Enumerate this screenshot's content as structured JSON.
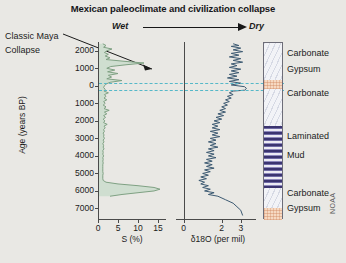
{
  "figure": {
    "title": "Mexican paleoclimate and civilization collapse",
    "watermark": "NOAA",
    "background_color": "#e9e8e4"
  },
  "direction_annotation": {
    "left_label": "Wet",
    "right_label": "Dry",
    "arrow_icon": "right-arrow-icon"
  },
  "event_annotation": {
    "line1": "Classic Maya",
    "line2": "Collapse",
    "points_to_age_bp": 0
  },
  "axes": {
    "y_title": "Age (years BP)",
    "y_ticks": [
      "2000",
      "1000",
      "0",
      "1000",
      "2000",
      "3000",
      "4000",
      "5000",
      "6000",
      "7000"
    ],
    "y_tick_values": [
      -2000,
      -1000,
      0,
      1000,
      2000,
      3000,
      4000,
      5000,
      6000,
      7000
    ],
    "y_range_bp": [
      -2500,
      7600
    ]
  },
  "stratigraphy": {
    "column_name": "core-lithology-column",
    "units": [
      {
        "label": "Carbonate",
        "pattern": "carbonate",
        "top_bp": -2500,
        "bottom_bp": -400,
        "color": "#f2f3f7"
      },
      {
        "label": "Gypsum",
        "pattern": "gypsum",
        "top_bp": -400,
        "bottom_bp": 150,
        "color": "#f6d9c2"
      },
      {
        "label": "Carbonate",
        "pattern": "carbonate",
        "top_bp": 150,
        "bottom_bp": 2250,
        "color": "#f2f3f7"
      },
      {
        "label": "Laminated",
        "pattern": "laminated-mud",
        "top_bp": 2250,
        "bottom_bp": 5750,
        "color": "#3b3470"
      },
      {
        "label": "Mud",
        "pattern": "laminated-mud-label-cont",
        "top_bp": 2250,
        "bottom_bp": 5750,
        "color": "#3b3470"
      },
      {
        "label": "Carbonate",
        "pattern": "carbonate",
        "top_bp": 5750,
        "bottom_bp": 6900,
        "color": "#f2f3f7"
      },
      {
        "label": "Gypsum",
        "pattern": "gypsum",
        "top_bp": 6900,
        "bottom_bp": 7600,
        "color": "#f6d9c2"
      }
    ]
  },
  "markers": {
    "dashed_color": "#56b8c8",
    "ages_bp": [
      -150,
      250
    ]
  },
  "chart_data": [
    {
      "type": "line",
      "name": "sulfur-record",
      "title": "",
      "xlabel": "S (%)",
      "ylabel": "Age (years BP)",
      "orientation": "vertical-depth",
      "line_color": "#7fa183",
      "fill_color": "#cfded0",
      "xlim": [
        0,
        17
      ],
      "xticks": [
        0,
        5,
        10,
        15
      ],
      "xticklabels": [
        "0",
        "5",
        "10",
        "15"
      ],
      "ylim_bp": [
        -2500,
        7600
      ],
      "grid": false,
      "x": [
        1.2,
        2.0,
        1.4,
        3.5,
        2.2,
        1.6,
        2.6,
        1.8,
        3.0,
        2.0,
        6.5,
        11.5,
        7.0,
        3.2,
        2.2,
        4.2,
        2.4,
        5.0,
        2.6,
        3.4,
        2.2,
        6.0,
        3.0,
        2.0,
        1.6,
        1.4,
        1.8,
        1.5,
        2.6,
        1.6,
        2.0,
        1.5,
        2.2,
        1.4,
        1.8,
        1.3,
        2.0,
        1.5,
        2.8,
        1.6,
        2.2,
        1.4,
        1.9,
        1.3,
        1.7,
        1.4,
        2.3,
        1.5,
        1.8,
        1.4,
        1.6,
        1.3,
        1.5,
        1.4,
        1.6,
        1.3,
        1.5,
        1.2,
        1.4,
        1.3,
        1.5,
        1.2,
        1.3,
        1.2,
        1.4,
        1.2,
        1.3,
        1.2,
        1.3,
        1.2,
        1.2,
        1.2,
        1.2,
        1.2,
        1.3,
        1.2,
        1.2,
        1.2,
        1.3,
        2.0,
        5.0,
        10.0,
        14.0,
        15.5,
        14.0,
        10.0,
        6.0,
        3.0
      ],
      "y": [
        -2400,
        -2300,
        -2200,
        -2100,
        -2000,
        -1900,
        -1800,
        -1700,
        -1600,
        -1500,
        -1400,
        -1300,
        -1200,
        -1100,
        -1000,
        -900,
        -800,
        -700,
        -600,
        -500,
        -400,
        -300,
        -200,
        -100,
        0,
        100,
        200,
        300,
        400,
        500,
        600,
        700,
        800,
        900,
        1000,
        1100,
        1200,
        1300,
        1400,
        1500,
        1600,
        1700,
        1800,
        1900,
        2000,
        2100,
        2200,
        2300,
        2400,
        2500,
        2600,
        2700,
        2800,
        2900,
        3000,
        3100,
        3200,
        3300,
        3400,
        3500,
        3600,
        3700,
        3800,
        3900,
        4000,
        4100,
        4200,
        4300,
        4400,
        4500,
        4600,
        4700,
        4800,
        4900,
        5000,
        5100,
        5200,
        5300,
        5400,
        5500,
        5600,
        5700,
        5800,
        5900,
        6000,
        6100,
        6200,
        6300
      ]
    },
    {
      "type": "line",
      "name": "oxygen-isotope-record",
      "title": "",
      "xlabel": "δ18O (per mil)",
      "ylabel": "",
      "orientation": "vertical-depth",
      "line_color": "#3d5a72",
      "xlim": [
        -0.4,
        3.8
      ],
      "xticks": [
        0,
        2,
        3
      ],
      "xticklabels": [
        "0",
        "2",
        "3"
      ],
      "ylim_bp": [
        -2500,
        7600
      ],
      "grid": false,
      "x": [
        2.6,
        2.9,
        2.5,
        3.0,
        2.6,
        3.1,
        2.5,
        2.9,
        2.4,
        3.0,
        2.6,
        3.1,
        2.5,
        2.8,
        2.4,
        3.0,
        2.5,
        2.9,
        2.4,
        2.8,
        2.3,
        2.9,
        2.4,
        3.0,
        2.5,
        3.2,
        3.3,
        3.2,
        2.6,
        2.4,
        2.6,
        2.3,
        2.5,
        2.2,
        2.4,
        2.1,
        2.3,
        2.0,
        2.2,
        1.9,
        2.2,
        1.8,
        2.1,
        1.7,
        2.0,
        1.6,
        1.9,
        1.5,
        1.8,
        1.5,
        1.9,
        1.4,
        1.8,
        1.5,
        1.9,
        1.4,
        1.7,
        1.3,
        1.7,
        1.4,
        1.8,
        1.3,
        1.6,
        1.2,
        1.6,
        1.3,
        1.7,
        1.2,
        1.5,
        1.1,
        1.5,
        1.2,
        1.6,
        1.1,
        1.4,
        1.0,
        1.3,
        0.9,
        1.2,
        0.8,
        1.1,
        0.9,
        1.3,
        1.0,
        1.4,
        1.1,
        1.6,
        1.3,
        1.8,
        2.2,
        2.6,
        2.8,
        3.0,
        3.1,
        3.2
      ],
      "y": [
        -2400,
        -2300,
        -2250,
        -2150,
        -2050,
        -1950,
        -1850,
        -1750,
        -1650,
        -1550,
        -1450,
        -1350,
        -1250,
        -1150,
        -1050,
        -950,
        -850,
        -750,
        -650,
        -550,
        -450,
        -350,
        -250,
        -150,
        -50,
        50,
        150,
        250,
        300,
        400,
        500,
        600,
        700,
        800,
        900,
        1000,
        1100,
        1200,
        1300,
        1400,
        1500,
        1600,
        1700,
        1800,
        1900,
        2000,
        2100,
        2200,
        2300,
        2400,
        2500,
        2600,
        2700,
        2800,
        2900,
        3000,
        3100,
        3200,
        3300,
        3400,
        3500,
        3600,
        3700,
        3800,
        3900,
        4000,
        4100,
        4200,
        4300,
        4400,
        4500,
        4600,
        4700,
        4800,
        4900,
        5000,
        5100,
        5200,
        5300,
        5400,
        5500,
        5600,
        5700,
        5800,
        5900,
        6000,
        6100,
        6200,
        6300,
        6500,
        6700,
        6900,
        7100,
        7400
      ]
    }
  ]
}
